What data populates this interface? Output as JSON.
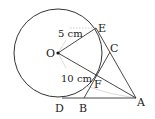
{
  "diagram": {
    "type": "geometry-figure",
    "points": {
      "O": {
        "label": "O",
        "x": 58,
        "y": 53
      },
      "E": {
        "label": "E",
        "x": 96,
        "y": 28
      },
      "C": {
        "label": "C",
        "x": 108,
        "y": 53
      },
      "F": {
        "label": "F",
        "x": 96,
        "y": 77
      },
      "D": {
        "label": "D",
        "x": 62,
        "y": 98
      },
      "B": {
        "label": "B",
        "x": 84,
        "y": 98
      },
      "A": {
        "label": "A",
        "x": 136,
        "y": 98
      }
    },
    "circle": {
      "center": "O",
      "radius": 44
    },
    "measurements": {
      "OE": "5 cm",
      "OA_part": "10 cm"
    },
    "colors": {
      "stroke": "#333333",
      "faint": "#bbbbbb",
      "text": "#222222"
    }
  }
}
